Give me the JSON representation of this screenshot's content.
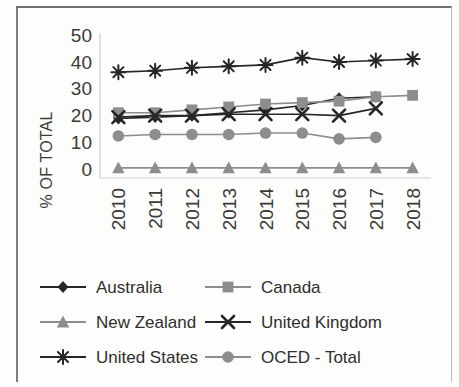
{
  "chart_data": {
    "type": "line",
    "title": "",
    "xlabel": "",
    "ylabel": "% OF TOTAL",
    "categories": [
      "2010",
      "2011",
      "2012",
      "2013",
      "2014",
      "2015",
      "2016",
      "2017",
      "2018"
    ],
    "ylim": [
      0,
      50
    ],
    "yticks": [
      0,
      10,
      20,
      30,
      40,
      50
    ],
    "xtick_rotation": -90,
    "grid": false,
    "legend_position": "bottom",
    "series": [
      {
        "name": "Australia",
        "marker": "diamond",
        "color": "#262626",
        "values": [
          20.5,
          21.0,
          21.5,
          22.5,
          23.5,
          25.0,
          27.5,
          28.0,
          null
        ]
      },
      {
        "name": "Canada",
        "marker": "square",
        "color": "#8d8d8d",
        "values": [
          22.5,
          22.5,
          23.5,
          24.5,
          25.5,
          26.0,
          26.5,
          28.0,
          28.5
        ]
      },
      {
        "name": "New Zealand",
        "marker": "triangle",
        "color": "#8d8d8d",
        "values": [
          3.5,
          3.5,
          3.5,
          3.5,
          3.5,
          3.5,
          3.5,
          3.5,
          3.5
        ]
      },
      {
        "name": "United Kingdom",
        "marker": "x",
        "color": "#262626",
        "values": [
          21.0,
          21.5,
          21.5,
          22.0,
          22.0,
          22.0,
          21.5,
          24.0,
          null
        ]
      },
      {
        "name": "United States",
        "marker": "asterisk",
        "color": "#262626",
        "values": [
          36.5,
          37.0,
          38.0,
          38.5,
          39.0,
          41.5,
          40.0,
          40.5,
          41.0
        ]
      },
      {
        "name": "OCED - Total",
        "marker": "circle",
        "color": "#8d8d8d",
        "values": [
          14.5,
          15.0,
          15.0,
          15.0,
          15.5,
          15.5,
          13.5,
          14.0,
          null
        ]
      }
    ]
  },
  "axis": {
    "y_title": "% OF TOTAL",
    "y_labels": [
      "50",
      "40",
      "30",
      "20",
      "10",
      "0"
    ],
    "x_labels": [
      "2010",
      "2011",
      "2012",
      "2013",
      "2014",
      "2015",
      "2016",
      "2017",
      "2018"
    ]
  },
  "legend": {
    "items": [
      {
        "label": "Australia",
        "marker": "diamond",
        "tone": "dark"
      },
      {
        "label": "Canada",
        "marker": "square",
        "tone": "mid"
      },
      {
        "label": "New Zealand",
        "marker": "triangle",
        "tone": "mid"
      },
      {
        "label": "United Kingdom",
        "marker": "x",
        "tone": "dark"
      },
      {
        "label": "United States",
        "marker": "asterisk",
        "tone": "dark"
      },
      {
        "label": "OCED - Total",
        "marker": "circle",
        "tone": "mid"
      }
    ]
  },
  "colors": {
    "dark": "#262626",
    "mid": "#8d8d8d",
    "background": "#fdfdfc",
    "plot_border": "#cfcfcf",
    "text": "#3a3a3a"
  }
}
